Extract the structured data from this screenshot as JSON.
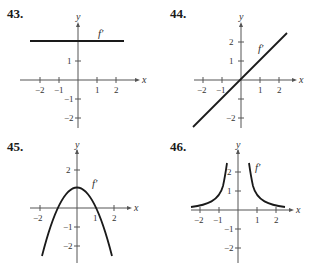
{
  "panels": [
    {
      "number": "43.",
      "func_label": "f′",
      "x_axis_label": "x",
      "y_axis_label": "y",
      "description": "horizontal line y = 2"
    },
    {
      "number": "44.",
      "func_label": "f′",
      "x_axis_label": "x",
      "y_axis_label": "y",
      "description": "line y = x"
    },
    {
      "number": "45.",
      "func_label": "f′",
      "x_axis_label": "x",
      "y_axis_label": "y",
      "description": "parabola y = 1 - x^2"
    },
    {
      "number": "46.",
      "func_label": "f′",
      "x_axis_label": "x",
      "y_axis_label": "y",
      "description": "y = 1/x^2"
    }
  ],
  "ticks": {
    "x": [
      "−2",
      "−1",
      "1",
      "2"
    ],
    "y_pos": [
      "1",
      "2"
    ],
    "y_neg": [
      "−1",
      "−2"
    ]
  },
  "colors": {
    "curve": "#1a1a1a",
    "axis": "#555555"
  }
}
